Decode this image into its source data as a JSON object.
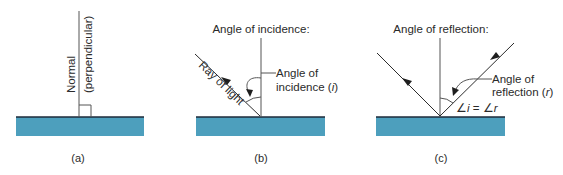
{
  "colors": {
    "water": "#4d9fbd",
    "surface_line": "#1c2a3a",
    "line": "#555555",
    "text": "#2a2a2a"
  },
  "panels": [
    {
      "id": "a",
      "caption": "(a)",
      "normal_label_line1": "Normal",
      "normal_label_line2": "(perpendicular)"
    },
    {
      "id": "b",
      "caption": "(b)",
      "title": "Angle of incidence:",
      "ray_label": "Ray of light",
      "angle_label_line1": "Angle of",
      "angle_label_line2_prefix": "incidence (",
      "angle_symbol": "i",
      "angle_label_line2_suffix": ")"
    },
    {
      "id": "c",
      "caption": "(c)",
      "title": "Angle of reflection:",
      "angle_label_line1": "Angle of",
      "angle_label_line2_prefix": "reflection (",
      "angle_symbol": "r",
      "angle_label_line2_suffix": ")",
      "equation_angle": "∠",
      "equation_i": "i",
      "equation_eq": " = ",
      "equation_r": "r"
    }
  ]
}
